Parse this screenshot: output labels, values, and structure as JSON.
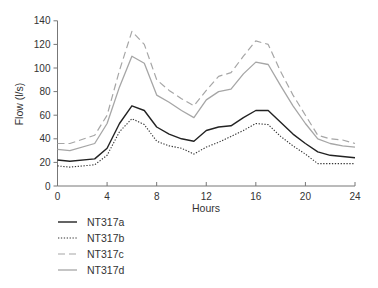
{
  "chart_data": {
    "type": "line",
    "title": "",
    "xlabel": "Hours",
    "ylabel": "Flow (l/s)",
    "xlim": [
      0,
      24
    ],
    "ylim": [
      0,
      140
    ],
    "xticks": [
      0,
      4,
      8,
      12,
      16,
      20,
      24
    ],
    "yticks": [
      0,
      20,
      40,
      60,
      80,
      100,
      120,
      140
    ],
    "grid": false,
    "legend_position": "bottom-left",
    "x": [
      0,
      1,
      3,
      4,
      5,
      6,
      7,
      8,
      9,
      10,
      11,
      12,
      13,
      14,
      15,
      16,
      17,
      18,
      19,
      20,
      21,
      22,
      23,
      24
    ],
    "series": [
      {
        "name": "NT317a",
        "style": "solid",
        "color": "#222222",
        "values": [
          22,
          21,
          23,
          32,
          53,
          68,
          64,
          50,
          44,
          40,
          38,
          47,
          50,
          51,
          58,
          64,
          64,
          54,
          44,
          36,
          29,
          26,
          25,
          24
        ]
      },
      {
        "name": "NT317b",
        "style": "dotted",
        "color": "#333333",
        "values": [
          17,
          16,
          18,
          26,
          46,
          57,
          52,
          38,
          34,
          32,
          27,
          33,
          37,
          42,
          47,
          53,
          52,
          42,
          34,
          27,
          19,
          19,
          19,
          19
        ]
      },
      {
        "name": "NT317c",
        "style": "dashed",
        "color": "#a6a6a6",
        "values": [
          36,
          36,
          43,
          60,
          98,
          131,
          120,
          90,
          81,
          74,
          68,
          81,
          93,
          96,
          110,
          123,
          120,
          97,
          77,
          60,
          43,
          40,
          39,
          36
        ]
      },
      {
        "name": "NT317d",
        "style": "solid",
        "color": "#a6a6a6",
        "values": [
          31,
          30,
          36,
          53,
          84,
          110,
          104,
          77,
          71,
          64,
          58,
          73,
          80,
          82,
          95,
          105,
          103,
          85,
          68,
          53,
          40,
          36,
          34,
          33
        ]
      }
    ]
  }
}
